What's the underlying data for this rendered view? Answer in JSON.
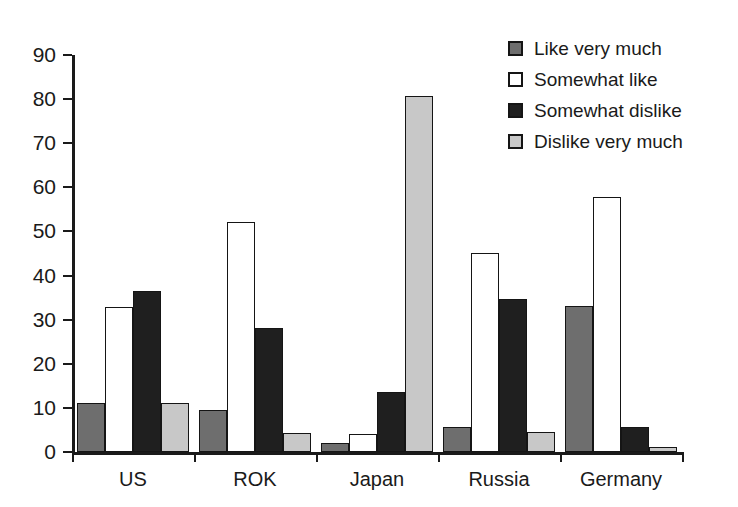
{
  "chart_data": {
    "type": "bar",
    "title": "",
    "subtitle": "",
    "xlabel": "",
    "ylabel": "",
    "categories": [
      "US",
      "ROK",
      "Japan",
      "Russia",
      "Germany"
    ],
    "series": [
      {
        "name": "Like very much",
        "color": "#6e6e6e",
        "values": [
          11.2,
          9.6,
          2.0,
          5.6,
          33.2
        ]
      },
      {
        "name": "Somewhat like",
        "color": "#ffffff",
        "values": [
          32.8,
          52.2,
          4.0,
          45.2,
          57.8
        ]
      },
      {
        "name": "Somewhat dislike",
        "color": "#1f1f1f",
        "values": [
          36.4,
          28.1,
          13.6,
          34.8,
          5.6
        ]
      },
      {
        "name": "Dislike very much",
        "color": "#c8c8c8",
        "values": [
          11.0,
          4.2,
          80.6,
          4.6,
          1.1
        ]
      }
    ],
    "ylim": [
      0,
      90
    ],
    "yticks": [
      0,
      10,
      20,
      30,
      40,
      50,
      60,
      70,
      80,
      90
    ],
    "ytick_labels": [
      "0",
      "10",
      "20",
      "30",
      "40",
      "50",
      "60",
      "70",
      "80",
      "90"
    ],
    "grid": false,
    "legend_position": "top-right",
    "axis_color": "#1a1a1a"
  },
  "legend": {
    "items": [
      {
        "label": "Like very much",
        "swatch": "#6e6e6e"
      },
      {
        "label": "Somewhat like",
        "swatch": "#ffffff"
      },
      {
        "label": "Somewhat dislike",
        "swatch": "#1f1f1f"
      },
      {
        "label": "Dislike very much",
        "swatch": "#c8c8c8"
      }
    ]
  }
}
